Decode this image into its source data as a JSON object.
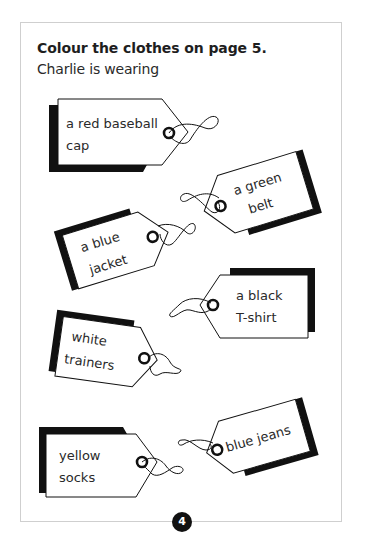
{
  "page": {
    "heading": "Colour the clothes on page 5.",
    "intro": "Charlie is wearing",
    "page_number": "4"
  },
  "tags": [
    {
      "line1": "a red baseball",
      "line2": "cap"
    },
    {
      "line1": "a green",
      "line2": "belt"
    },
    {
      "line1": "a blue",
      "line2": "jacket"
    },
    {
      "line1": "a black",
      "line2": "T-shirt"
    },
    {
      "line1": "white",
      "line2": "trainers"
    },
    {
      "line1": "blue jeans",
      "line2": ""
    },
    {
      "line1": "yellow",
      "line2": "socks"
    }
  ],
  "colors": {
    "ink": "#111111",
    "frame_border": "#cfcfcf",
    "text": "#2a2a2a"
  }
}
